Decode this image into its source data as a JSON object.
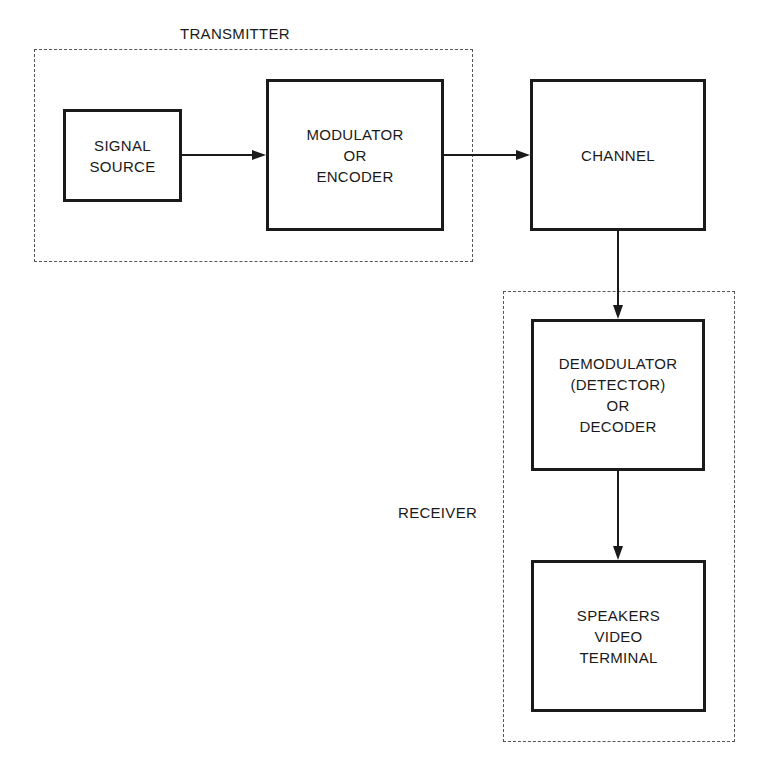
{
  "groups": {
    "transmitter": {
      "label": "TRANSMITTER"
    },
    "receiver": {
      "label": "RECEIVER"
    }
  },
  "blocks": {
    "signal_source": {
      "lines": [
        "SIGNAL",
        "SOURCE"
      ]
    },
    "modulator": {
      "lines": [
        "MODULATOR",
        "OR",
        "ENCODER"
      ]
    },
    "channel": {
      "lines": [
        "CHANNEL"
      ]
    },
    "demodulator": {
      "lines": [
        "DEMODULATOR",
        "(DETECTOR)",
        "OR",
        "DECODER"
      ]
    },
    "output": {
      "lines": [
        "SPEAKERS",
        "VIDEO",
        "TERMINAL"
      ]
    }
  },
  "connections": [
    {
      "from": "signal_source",
      "to": "modulator"
    },
    {
      "from": "modulator",
      "to": "channel"
    },
    {
      "from": "channel",
      "to": "demodulator"
    },
    {
      "from": "demodulator",
      "to": "output"
    }
  ],
  "colors": {
    "stroke": "#1a1a1a",
    "dashed": "#555555",
    "background": "#ffffff"
  }
}
